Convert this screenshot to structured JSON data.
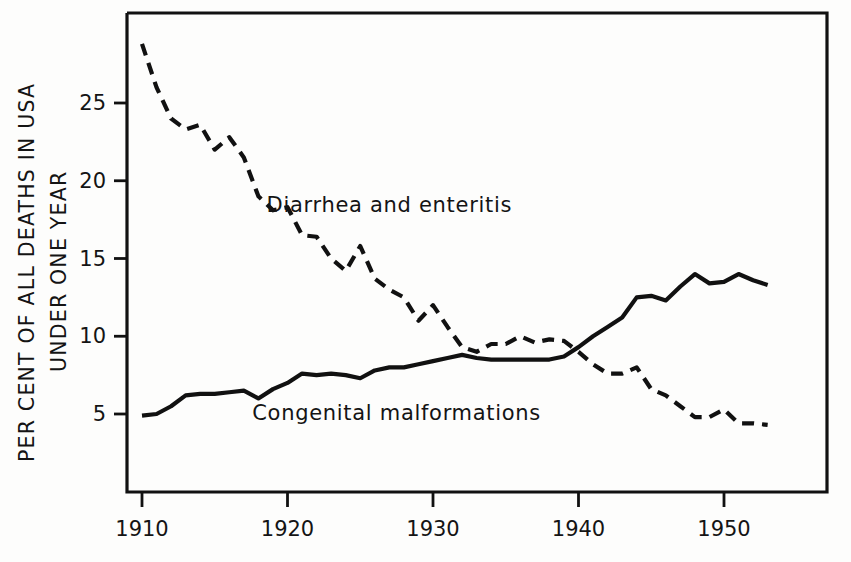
{
  "chart_data": {
    "type": "line",
    "title": "",
    "xlabel": "",
    "ylabel": "PER CENT OF ALL DEATHS IN USA UNDER ONE YEAR",
    "ylabel_line1": "PER CENT OF ALL DEATHS IN USA",
    "ylabel_line2": "UNDER ONE YEAR",
    "xlim": [
      1910,
      1953
    ],
    "ylim": [
      0,
      29.5
    ],
    "grid": false,
    "legend_position": "inline-annotations",
    "xticks": [
      1910,
      1920,
      1930,
      1940,
      1950
    ],
    "xticklabels": [
      "1910",
      "1920",
      "1930",
      "1940",
      "1950"
    ],
    "yticks": [
      5,
      10,
      15,
      20,
      25
    ],
    "yticklabels": [
      "5",
      "10",
      "15",
      "20",
      "25"
    ],
    "series": [
      {
        "name": "Diarrhea and enteritis",
        "style": "dashed",
        "color": "#111111",
        "label_x": 1927.0,
        "label_y": 18.0,
        "x": [
          1910,
          1911,
          1912,
          1913,
          1914,
          1915,
          1916,
          1917,
          1918,
          1919,
          1920,
          1921,
          1922,
          1923,
          1924,
          1925,
          1926,
          1927,
          1928,
          1929,
          1930,
          1931,
          1932,
          1933,
          1934,
          1935,
          1936,
          1937,
          1938,
          1939,
          1940,
          1941,
          1942,
          1943,
          1944,
          1945,
          1946,
          1947,
          1948,
          1949,
          1950,
          1951,
          1952,
          1953
        ],
        "values": [
          28.8,
          26.0,
          24.0,
          23.3,
          23.6,
          22.0,
          22.8,
          21.5,
          19.0,
          18.1,
          18.3,
          16.5,
          16.4,
          15.0,
          14.2,
          15.8,
          13.7,
          13.0,
          12.5,
          11.0,
          12.0,
          10.6,
          9.3,
          9.0,
          9.5,
          9.5,
          10.0,
          9.6,
          9.8,
          9.7,
          9.0,
          8.2,
          7.6,
          7.6,
          8.0,
          6.6,
          6.2,
          5.5,
          4.8,
          4.8,
          5.3,
          4.4,
          4.4,
          4.3
        ]
      },
      {
        "name": "Congenital malformations",
        "style": "solid",
        "color": "#111111",
        "label_x": 1927.5,
        "label_y": 4.6,
        "x": [
          1910,
          1911,
          1912,
          1913,
          1914,
          1915,
          1916,
          1917,
          1918,
          1919,
          1920,
          1921,
          1922,
          1923,
          1924,
          1925,
          1926,
          1927,
          1928,
          1929,
          1930,
          1931,
          1932,
          1933,
          1934,
          1935,
          1936,
          1937,
          1938,
          1939,
          1940,
          1941,
          1942,
          1943,
          1944,
          1945,
          1946,
          1947,
          1948,
          1949,
          1950,
          1951,
          1952,
          1953
        ],
        "values": [
          4.9,
          5.0,
          5.5,
          6.2,
          6.3,
          6.3,
          6.4,
          6.5,
          6.0,
          6.6,
          7.0,
          7.6,
          7.5,
          7.6,
          7.5,
          7.3,
          7.8,
          8.0,
          8.0,
          8.2,
          8.4,
          8.6,
          8.8,
          8.6,
          8.5,
          8.5,
          8.5,
          8.5,
          8.5,
          8.7,
          9.3,
          10.0,
          10.6,
          11.2,
          12.5,
          12.6,
          12.3,
          13.2,
          14.0,
          13.4,
          13.5,
          14.0,
          13.6,
          13.3
        ]
      }
    ]
  },
  "axis": {
    "y_label_line1": "PER CENT OF ALL DEATHS IN USA",
    "y_label_line2": "UNDER ONE YEAR"
  }
}
